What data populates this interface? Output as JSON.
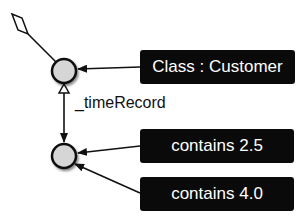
{
  "diagram": {
    "nodes": [
      {
        "id": "time-node",
        "kind": "circle",
        "fill": "#d6d6d6",
        "stroke": "#111111"
      },
      {
        "id": "record-node",
        "kind": "circle",
        "fill": "#d6d6d6",
        "stroke": "#111111"
      }
    ],
    "boxes": [
      {
        "id": "class-customer",
        "label": "Class : Customer"
      },
      {
        "id": "contains-2-5",
        "label": "contains 2.5"
      },
      {
        "id": "contains-4-0",
        "label": "contains 4.0"
      }
    ],
    "edges": [
      {
        "from": "time-node",
        "to": "aggregation-diamond",
        "type": "aggregation"
      },
      {
        "from": "class-customer",
        "to": "time-node",
        "type": "arrow"
      },
      {
        "from": "record-node",
        "to": "time-node",
        "type": "inheritance",
        "label": "_timeRecord"
      },
      {
        "from": "time-node",
        "to": "record-node",
        "type": "arrow"
      },
      {
        "from": "contains-2-5",
        "to": "record-node",
        "type": "arrow"
      },
      {
        "from": "contains-4-0",
        "to": "record-node",
        "type": "arrow"
      }
    ],
    "edge_label": "_timeRecord",
    "colors": {
      "box_bg": "#0a0a0a",
      "box_text": "#ffffff",
      "node_fill": "#d6d6d6",
      "line": "#111111"
    }
  }
}
